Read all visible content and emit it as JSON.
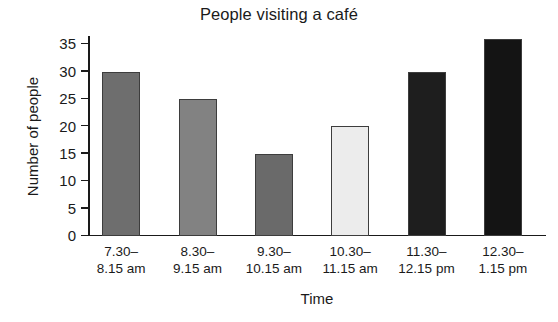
{
  "chart_data": {
    "type": "bar",
    "title": "People visiting a café",
    "xlabel": "Time",
    "ylabel": "Number of people",
    "categories": [
      "7.30–8.15 am",
      "8.30–9.15 am",
      "9.30–10.15 am",
      "10.30–11.15 am",
      "11.30–12.15 pm",
      "12.30–1.15 pm"
    ],
    "category_lines": [
      [
        "7.30–",
        "8.15 am"
      ],
      [
        "8.30–",
        "9.15 am"
      ],
      [
        "9.30–",
        "10.15 am"
      ],
      [
        "10.30–",
        "11.15 am"
      ],
      [
        "11.30–",
        "12.15 pm"
      ],
      [
        "12.30–",
        "1.15 pm"
      ]
    ],
    "values": [
      30,
      25,
      15,
      20,
      30,
      36
    ],
    "bar_colors": [
      "#6e6e6e",
      "#828282",
      "#6a6a6a",
      "#ececec",
      "#1e1e1e",
      "#141414"
    ],
    "bar_border_color": "#3d3d3d",
    "ylim": [
      0,
      36.5
    ],
    "ytick_values": [
      0,
      5,
      10,
      15,
      20,
      25,
      30,
      35
    ],
    "ytick_labels": [
      "0",
      "5",
      "10",
      "15",
      "20",
      "25",
      "30",
      "35"
    ],
    "grid": false,
    "legend": "none",
    "background": "#ffffff"
  }
}
